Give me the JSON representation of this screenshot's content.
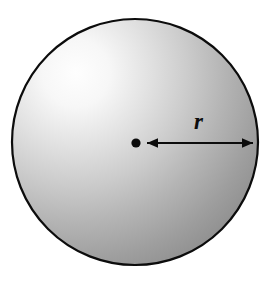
{
  "figure": {
    "type": "geometry-diagram",
    "background_color": "#ffffff",
    "circle": {
      "name": "sphere-circle",
      "center_x": 135,
      "center_y": 142,
      "radius": 123,
      "outline_color": "#0c0c0c",
      "outline_width": 2.2,
      "shading": {
        "type": "radial-gradient",
        "highlight_x": 75,
        "highlight_y": 93,
        "highlight_color": "#fdfdfd",
        "mid_color": "#c2c2c2",
        "edge_color": "#8a8a8a",
        "shadow_color": "#838383"
      }
    },
    "center_dot": {
      "name": "center-point",
      "cx": 136,
      "cy": 143,
      "r": 4.6,
      "color": "#0c0c0c"
    },
    "radius_arrow": {
      "name": "radius-arrow",
      "x1": 147,
      "x2": 253,
      "y": 143,
      "color": "#0c0c0c",
      "stroke_width": 2.2,
      "arrowhead_length": 11,
      "arrowhead_half_width": 5,
      "double_headed": true
    },
    "label": {
      "text": "r",
      "x": 199,
      "y": 128,
      "color": "#0c0c0c",
      "style": "italic-serif-bold"
    }
  }
}
